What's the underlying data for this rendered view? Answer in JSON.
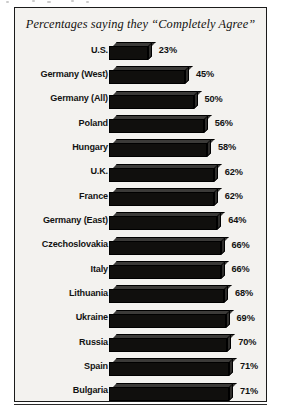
{
  "chart_data": {
    "type": "bar",
    "title": "Percentages saying they “Completely Agree”",
    "xlabel": "",
    "ylabel": "",
    "orientation": "horizontal",
    "grid": false,
    "legend": null,
    "xlim": [
      0,
      75
    ],
    "value_suffix": "%",
    "categories": [
      "U.S.",
      "Germany (West)",
      "Germany (All)",
      "Poland",
      "Hungary",
      "U.K.",
      "France",
      "Germany (East)",
      "Czechoslovakia",
      "Italy",
      "Lithuania",
      "Ukraine",
      "Russia",
      "Spain",
      "Bulgaria"
    ],
    "values": [
      23,
      45,
      50,
      56,
      58,
      62,
      62,
      64,
      66,
      66,
      68,
      69,
      70,
      71,
      71
    ],
    "value_labels": [
      "23%",
      "45%",
      "50%",
      "56%",
      "58%",
      "62%",
      "62%",
      "64%",
      "66%",
      "66%",
      "68%",
      "69%",
      "70%",
      "71%",
      "71%"
    ]
  },
  "style": {
    "bar_color": "#100f0d",
    "bar_bevel_color": "#3b3a38",
    "panel_background": "#f3f2ef",
    "frame_color": "#1b1b1b",
    "text_color": "#121212"
  },
  "artifacts": {
    "specks": [
      {
        "x": 6,
        "y": 1,
        "w": 3
      },
      {
        "x": 32,
        "y": 0,
        "w": 3
      },
      {
        "x": 47,
        "y": 1,
        "w": 4
      },
      {
        "x": 71,
        "y": 0,
        "w": 3
      },
      {
        "x": 86,
        "y": 1,
        "w": 3
      }
    ]
  }
}
